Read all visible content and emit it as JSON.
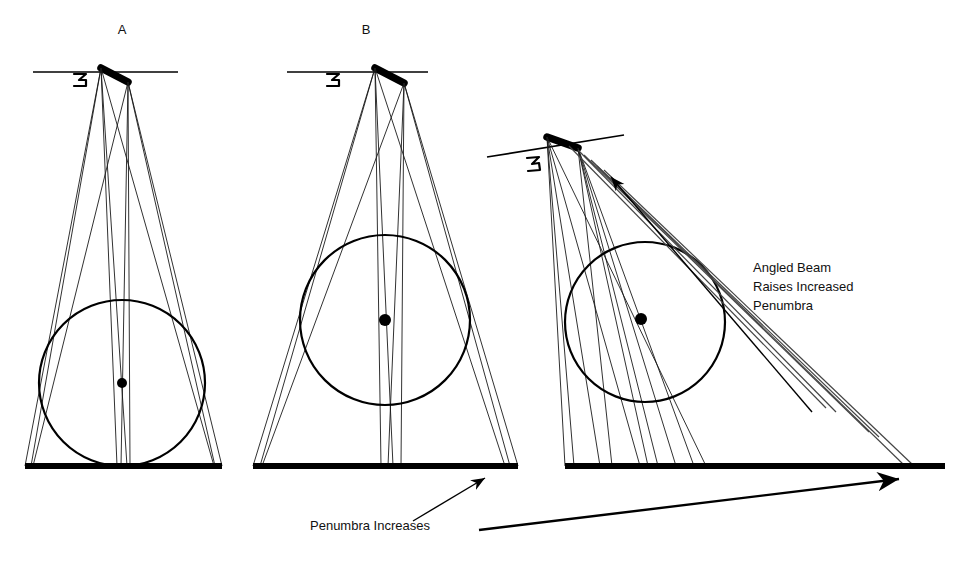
{
  "figure": {
    "type": "optics-penumbra-diagram",
    "background": "#ffffff",
    "ink": "#000000",
    "panels": [
      {
        "id": "A",
        "label": "A",
        "label_pos": {
          "x": 122,
          "y": 34
        },
        "source": {
          "x": 103,
          "y": 70,
          "length": 30,
          "angle_deg": 28
        },
        "reference_line": {
          "x1": 33,
          "y1": 72,
          "x2": 178,
          "y2": 72,
          "tilt_deg": 0
        },
        "marker_label": "3",
        "marker_pos": {
          "x": 80,
          "y": 79
        },
        "object_circle": {
          "cx": 122,
          "cy": 383,
          "r": 83
        },
        "object_center_dot": {
          "cx": 122,
          "cy": 383,
          "r": 5
        },
        "ground": {
          "x1": 25,
          "y1": 466,
          "x2": 222,
          "y2": 466
        },
        "umbra_halfwidth": 8,
        "penumbra_halfwidth": 98,
        "note": "narrow beam, smallest penumbra"
      },
      {
        "id": "B",
        "label": "B",
        "label_pos": {
          "x": 366,
          "y": 34
        },
        "source": {
          "x": 377,
          "y": 70,
          "length": 32,
          "angle_deg": 30
        },
        "reference_line": {
          "x1": 287,
          "y1": 72,
          "x2": 428,
          "y2": 72,
          "tilt_deg": 0
        },
        "marker_label": "3",
        "marker_pos": {
          "x": 333,
          "y": 79
        },
        "object_circle": {
          "cx": 385,
          "cy": 320,
          "r": 85
        },
        "object_center_dot": {
          "cx": 385,
          "cy": 320,
          "r": 6
        },
        "ground": {
          "x1": 253,
          "y1": 466,
          "x2": 518,
          "y2": 466
        },
        "umbra_halfwidth": 16,
        "penumbra_halfwidth": 132,
        "note": "wider beam, larger penumbra"
      },
      {
        "id": "C",
        "label": "",
        "label_pos": {
          "x": 700,
          "y": 34
        },
        "source": {
          "x": 549,
          "y": 140,
          "length": 34,
          "angle_deg": 22
        },
        "reference_line": {
          "x1": 487,
          "y1": 155,
          "x2": 624,
          "y2": 136,
          "tilt_deg": -8
        },
        "marker_label": "3",
        "marker_pos": {
          "x": 532,
          "y": 163
        },
        "object_circle": {
          "cx": 645,
          "cy": 322,
          "r": 80
        },
        "object_center_dot": {
          "cx": 641,
          "cy": 319,
          "r": 6
        },
        "ground": {
          "x1": 565,
          "y1": 466,
          "x2": 945,
          "y2": 466
        },
        "note": "angled beam, greatest penumbra"
      }
    ],
    "annotations": [
      {
        "name": "angled-beam-note",
        "lines": [
          "Angled Beam",
          "Raises Increased",
          "Penumbra"
        ],
        "x": 753,
        "y": 272,
        "line_height": 19
      },
      {
        "name": "penumbra-increases-caption",
        "lines": [
          "Penumbra Increases"
        ],
        "x": 310,
        "y": 530,
        "line_height": 19
      }
    ],
    "arrows": [
      {
        "name": "arrow-to-panel-b-base",
        "from": {
          "x": 413,
          "y": 521
        },
        "to": {
          "x": 485,
          "y": 478
        },
        "head": "end"
      },
      {
        "name": "arrow-to-panel-c-base",
        "from": {
          "x": 479,
          "y": 530
        },
        "to": {
          "x": 899,
          "y": 479
        },
        "head": "end"
      },
      {
        "name": "arrow-angled-beam-up",
        "from": {
          "x": 812,
          "y": 412
        },
        "to": {
          "x": 611,
          "y": 177
        },
        "head": "end"
      }
    ]
  }
}
